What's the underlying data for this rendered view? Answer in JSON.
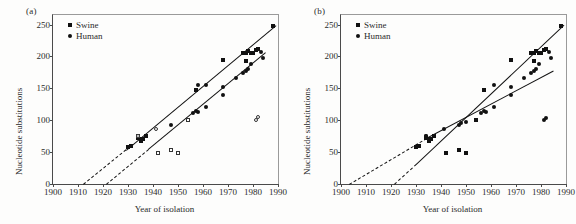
{
  "figure": {
    "panels": [
      {
        "id": "a",
        "label": "(a)",
        "legend": [
          {
            "marker": "filled-square",
            "label": "Swine"
          },
          {
            "marker": "filled-circle",
            "label": "Human"
          }
        ],
        "xaxis": {
          "label": "Year of isolation",
          "ticks": [
            "1900",
            "1910",
            "1920",
            "1930",
            "1940",
            "1950",
            "1960",
            "1970",
            "1980",
            "1990"
          ],
          "min": 1900,
          "max": 1990
        },
        "yaxis": {
          "label": "Nucleotide substitutions",
          "ticks": [
            "0",
            "50",
            "100",
            "150",
            "200",
            "250"
          ],
          "min": 0,
          "max": 265
        }
      },
      {
        "id": "b",
        "label": "(b)",
        "legend": [
          {
            "marker": "filled-square",
            "label": "Swine"
          },
          {
            "marker": "filled-circle",
            "label": "Human"
          }
        ],
        "xaxis": {
          "label": "Year of isolation",
          "ticks": [
            "1900",
            "1910",
            "1920",
            "1930",
            "1940",
            "1950",
            "1960",
            "1970",
            "1980",
            "1990"
          ],
          "min": 1900,
          "max": 1990
        },
        "yaxis": {
          "label": "Nucleotide substitutions",
          "ticks": [
            "0",
            "50",
            "100",
            "150",
            "200",
            "250"
          ],
          "min": 0,
          "max": 265
        }
      }
    ]
  },
  "chart_data": [
    {
      "type": "scatter",
      "panel": "a",
      "title": "",
      "xlabel": "Year of isolation",
      "ylabel": "Nucleotide substitutions",
      "xlim": [
        1900,
        1990
      ],
      "ylim": [
        0,
        265
      ],
      "xticks": [
        1900,
        1910,
        1920,
        1930,
        1940,
        1950,
        1960,
        1970,
        1980,
        1990
      ],
      "yticks": [
        0,
        50,
        100,
        150,
        200,
        250
      ],
      "grid": false,
      "legend_position": "top-left",
      "series": [
        {
          "name": "Swine",
          "marker": "filled-square",
          "points": [
            [
              1930,
              58
            ],
            [
              1931,
              60
            ],
            [
              1934,
              72
            ],
            [
              1935,
              68
            ],
            [
              1935,
              70
            ],
            [
              1936,
              71
            ],
            [
              1937,
              75
            ],
            [
              1957,
              148
            ],
            [
              1968,
              194
            ],
            [
              1976,
              205
            ],
            [
              1977,
              206
            ],
            [
              1977,
              193
            ],
            [
              1978,
              208
            ],
            [
              1979,
              206
            ],
            [
              1980,
              205
            ],
            [
              1981,
              210
            ],
            [
              1982,
              212
            ],
            [
              1988,
              247
            ]
          ]
        },
        {
          "name": "Human",
          "marker": "filled-circle",
          "points": [
            [
              1934,
              75
            ],
            [
              1947,
              93
            ],
            [
              1954,
              101
            ],
            [
              1956,
              112
            ],
            [
              1957,
              115
            ],
            [
              1958,
              113
            ],
            [
              1961,
              120
            ],
            [
              1958,
              156
            ],
            [
              1968,
              152
            ],
            [
              1968,
              140
            ],
            [
              1973,
              166
            ],
            [
              1976,
              174
            ],
            [
              1977,
              177
            ],
            [
              1978,
              181
            ],
            [
              1979,
              188
            ],
            [
              1983,
              207
            ],
            [
              1984,
              197
            ],
            [
              1961,
              156
            ]
          ]
        },
        {
          "name": "Swine (open / excluded)",
          "marker": "open-square",
          "points": [
            [
              1942,
              48
            ],
            [
              1947,
              53
            ],
            [
              1950,
              49
            ],
            [
              1954,
              101
            ],
            [
              1934,
              75
            ]
          ]
        },
        {
          "name": "Human (open / excluded)",
          "marker": "open-circle",
          "points": [
            [
              1934,
              76
            ],
            [
              1941,
              87
            ],
            [
              1981,
              100
            ],
            [
              1982,
              105
            ]
          ]
        }
      ],
      "trendlines": [
        {
          "name": "Swine regression",
          "style": "solid",
          "x": [
            1929,
            1989
          ],
          "y": [
            54,
            250
          ]
        },
        {
          "name": "Swine extrapolation",
          "style": "dashed",
          "x": [
            1912,
            1929
          ],
          "y": [
            0,
            54
          ]
        },
        {
          "name": "Human regression",
          "style": "solid",
          "x": [
            1938,
            1985
          ],
          "y": [
            55,
            207
          ]
        },
        {
          "name": "Human extrapolation",
          "style": "dashed",
          "x": [
            1921,
            1938
          ],
          "y": [
            0,
            55
          ]
        }
      ]
    },
    {
      "type": "scatter",
      "panel": "b",
      "title": "",
      "xlabel": "Year of isolation",
      "ylabel": "Nucleotide substitutions",
      "xlim": [
        1900,
        1990
      ],
      "ylim": [
        0,
        265
      ],
      "xticks": [
        1900,
        1910,
        1920,
        1930,
        1940,
        1950,
        1960,
        1970,
        1980,
        1990
      ],
      "yticks": [
        0,
        50,
        100,
        150,
        200,
        250
      ],
      "grid": false,
      "legend_position": "top-left",
      "series": [
        {
          "name": "Swine",
          "marker": "filled-square",
          "points": [
            [
              1930,
              58
            ],
            [
              1931,
              60
            ],
            [
              1934,
              72
            ],
            [
              1935,
              68
            ],
            [
              1935,
              70
            ],
            [
              1936,
              71
            ],
            [
              1937,
              75
            ],
            [
              1942,
              48
            ],
            [
              1947,
              53
            ],
            [
              1950,
              49
            ],
            [
              1954,
              101
            ],
            [
              1957,
              148
            ],
            [
              1968,
              194
            ],
            [
              1976,
              205
            ],
            [
              1977,
              206
            ],
            [
              1977,
              193
            ],
            [
              1978,
              208
            ],
            [
              1979,
              206
            ],
            [
              1980,
              205
            ],
            [
              1981,
              210
            ],
            [
              1982,
              212
            ],
            [
              1988,
              247
            ]
          ]
        },
        {
          "name": "Human",
          "marker": "filled-circle",
          "points": [
            [
              1934,
              75
            ],
            [
              1934,
              76
            ],
            [
              1941,
              87
            ],
            [
              1947,
              93
            ],
            [
              1948,
              95
            ],
            [
              1950,
              97
            ],
            [
              1954,
              101
            ],
            [
              1956,
              112
            ],
            [
              1957,
              115
            ],
            [
              1958,
              113
            ],
            [
              1961,
              120
            ],
            [
              1961,
              156
            ],
            [
              1968,
              152
            ],
            [
              1968,
              140
            ],
            [
              1973,
              166
            ],
            [
              1976,
              174
            ],
            [
              1977,
              177
            ],
            [
              1978,
              181
            ],
            [
              1979,
              188
            ],
            [
              1981,
              100
            ],
            [
              1982,
              103
            ],
            [
              1983,
              207
            ],
            [
              1984,
              197
            ]
          ]
        }
      ],
      "trendlines": [
        {
          "name": "Swine regression",
          "style": "solid",
          "x": [
            1930,
            1989
          ],
          "y": [
            32,
            250
          ]
        },
        {
          "name": "Swine extrapolation",
          "style": "dashed",
          "x": [
            1921,
            1930
          ],
          "y": [
            0,
            32
          ]
        },
        {
          "name": "Human regression",
          "style": "solid",
          "x": [
            1934,
            1985
          ],
          "y": [
            72,
            178
          ]
        },
        {
          "name": "Human extrapolation",
          "style": "dashed",
          "x": [
            1903,
            1934
          ],
          "y": [
            0,
            72
          ]
        }
      ]
    }
  ]
}
